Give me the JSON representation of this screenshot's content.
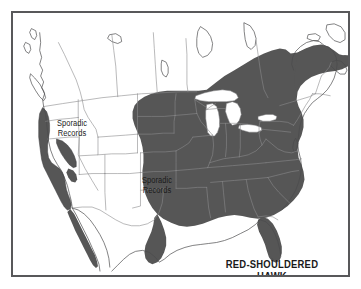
{
  "figure": {
    "kind": "species-range-map",
    "region": "North America",
    "frame_color": "#58585a",
    "background_color": "#ffffff"
  },
  "title": {
    "line1": "RED-SHOULDERED",
    "line2": "HAWK"
  },
  "annotations": [
    {
      "id": "sporadic-northwest",
      "line1": "Sporadic",
      "line2": "Records"
    },
    {
      "id": "sporadic-central",
      "line1": "Sporadic",
      "line2": "Records"
    }
  ],
  "legend": {
    "range_fill_color": "#565656",
    "land_fill_color": "#ffffff",
    "border_line_color": "#8a8a8c",
    "coast_line_color": "#4a4a4c",
    "water_fill_color": "#ffffff"
  },
  "map_features": {
    "shaded_range_areas": [
      "eastern-united-states",
      "great-lakes-states",
      "northeast-new-england",
      "southern-ontario-quebec",
      "southeast-florida-peninsula",
      "east-texas-gulf-coast",
      "california-coastal-strip",
      "sierra-nevada-patch",
      "baja-california-coastal-strip"
    ],
    "unshaded_water_bodies": [
      "lake-superior",
      "lake-michigan",
      "lake-huron",
      "lake-erie",
      "lake-ontario",
      "gulf-of-mexico",
      "atlantic-ocean",
      "pacific-ocean"
    ]
  }
}
